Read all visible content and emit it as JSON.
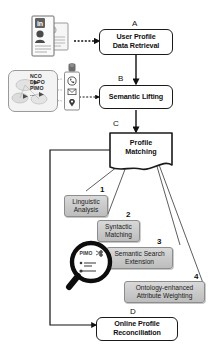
{
  "diagram": {
    "stages": [
      {
        "id": "A",
        "letter": "A",
        "label_line1": "User Profile",
        "label_line2": "Data Retrieval",
        "name": "user-profile-data-retrieval"
      },
      {
        "id": "B",
        "letter": "B",
        "label_line1": "Semantic Lifting",
        "label_line2": "",
        "name": "semantic-lifting"
      },
      {
        "id": "C",
        "letter": "C",
        "label_line1": "Profile",
        "label_line2": "Matching",
        "name": "profile-matching"
      },
      {
        "id": "D",
        "letter": "D",
        "label_line1": "Online Profile",
        "label_line2": "Reconciliation",
        "name": "online-profile-reconciliation"
      }
    ],
    "steps": [
      {
        "number": "1",
        "label_line1": "Linguistic",
        "label_line2": "Analysis",
        "name": "linguistic-analysis"
      },
      {
        "number": "2",
        "label_line1": "Syntactic",
        "label_line2": "Matching",
        "name": "syntactic-matching"
      },
      {
        "number": "3",
        "label_line1": "Semantic Search",
        "label_line2": "Extension",
        "name": "semantic-search-extension"
      },
      {
        "number": "4",
        "label_line1": "Ontology-enhanced",
        "label_line2": "Attribute Weighting",
        "name": "ontology-enhanced-attribute-weighting"
      }
    ],
    "ontologies": {
      "line1": "NCO",
      "line2": "DLPO",
      "line3": "PIMO",
      "line4": "..."
    },
    "icons": {
      "social_profile_stack": "social-profile-documents-icon",
      "linkedin_badge": "linkedin-in-icon",
      "person_card": "person-profile-icon",
      "ontology_graph": "ontology-graph-icon",
      "smartphone": "smartphone-icon",
      "phone": "phone-icon",
      "envelope": "envelope-icon",
      "location_pin": "location-pin-icon",
      "contact_avatar": "contact-avatar-icon",
      "magnifier": "magnifying-glass-icon"
    },
    "colors": {
      "stroke": "#1a1a1a",
      "step_fill": "#cccccc",
      "step_stroke": "#8d8d8d",
      "panel_fill": "#f3f3f3",
      "background": "#ffffff"
    }
  }
}
